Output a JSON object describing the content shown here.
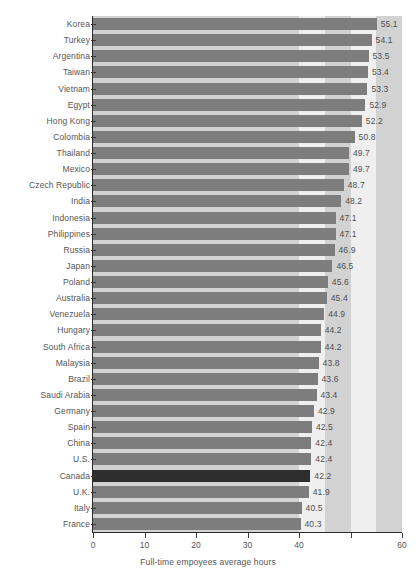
{
  "chart_data": {
    "type": "bar",
    "orientation": "horizontal",
    "title": "",
    "xlabel": "Full-time empoyees average hours",
    "ylabel": "",
    "xlim": [
      0,
      60
    ],
    "ylim": null,
    "grid": false,
    "legend": null,
    "xticks": [
      0,
      10,
      20,
      30,
      40,
      50,
      60
    ],
    "xtick_labels": [
      "0",
      "10",
      "20",
      "30",
      "40",
      "",
      "60"
    ],
    "highlight_category": "Canada",
    "categories": [
      "Korea",
      "Turkey",
      "Argentina",
      "Taiwan",
      "Vietnam",
      "Egypt",
      "Hong Kong",
      "Colombia",
      "Thailand",
      "Mexico",
      "Czech Republic",
      "India",
      "Indonesia",
      "Philippines",
      "Russia",
      "Japan",
      "Poland",
      "Australia",
      "Venezuela",
      "Hungary",
      "South Africa",
      "Malaysia",
      "Brazil",
      "Saudi Arabia",
      "Germany",
      "Spain",
      "China",
      "U.S.",
      "Canada",
      "U.K.",
      "Italy",
      "France"
    ],
    "values": [
      55.1,
      54.1,
      53.5,
      53.4,
      53.3,
      52.9,
      52.2,
      50.8,
      49.7,
      49.7,
      48.7,
      48.2,
      47.1,
      47.1,
      46.9,
      46.5,
      45.6,
      45.4,
      44.9,
      44.2,
      44.2,
      43.8,
      43.6,
      43.4,
      42.9,
      42.5,
      42.4,
      42.4,
      42.2,
      41.9,
      40.5,
      40.3
    ],
    "value_labels": [
      "55.1",
      "54.1",
      "53.5",
      "53.4",
      "53.3",
      "52.9",
      "52.2",
      "50.8",
      "49.7",
      "49.7",
      "48.7",
      "48.2",
      "47.1",
      "47.1",
      "46.9",
      "46.5",
      "45.6",
      "45.4",
      "44.9",
      "44.2",
      "44.2",
      "43.8",
      "43.6",
      "43.4",
      "42.9",
      "42.5",
      "42.4",
      "42.4",
      "42.2",
      "41.9",
      "40.5",
      "40.3"
    ],
    "colors": {
      "bar": "#7d7d7d",
      "bar_highlight": "#2e2e2e",
      "background": "#ffffff",
      "band_light": "#efefef",
      "band_medium": "#d2d2d2",
      "axis": "#2b2b2b",
      "text": "#555555"
    },
    "background_bands": [
      {
        "from": 0,
        "to": 40,
        "shade": "band_medium"
      },
      {
        "from": 40,
        "to": 45,
        "shade": "band_light"
      },
      {
        "from": 45,
        "to": 50,
        "shade": "band_medium"
      },
      {
        "from": 50,
        "to": 55,
        "shade": "band_light"
      },
      {
        "from": 55,
        "to": 60,
        "shade": "band_medium"
      }
    ]
  }
}
